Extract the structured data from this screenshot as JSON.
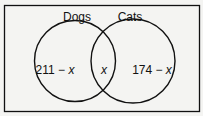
{
  "diagram": {
    "type": "venn",
    "sets": [
      {
        "name": "Dogs",
        "only_label": "211",
        "only_var": "x"
      },
      {
        "name": "Cats",
        "only_label": "174",
        "only_var": "x"
      }
    ],
    "intersection_label": "x",
    "minus": "−",
    "colors": {
      "stroke": "#111111",
      "background": "#f4f4f2"
    }
  }
}
